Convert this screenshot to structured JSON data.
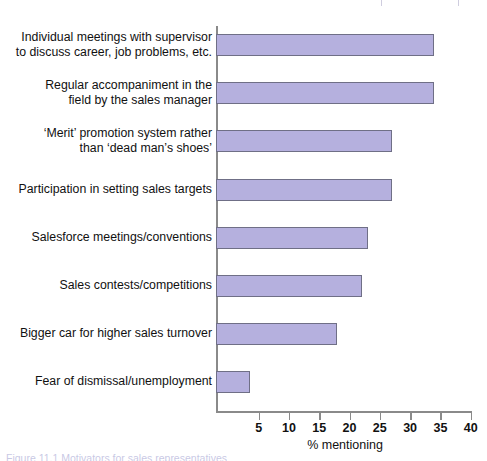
{
  "artifact": {
    "tab_name": "page-tab-fragment",
    "block_color": "#8e8bc4"
  },
  "colors": {
    "bar_fill": "#b5b0de",
    "bar_stroke": "#6f6f86",
    "axis": "#8a8a8a",
    "text": "#111111"
  },
  "caption": {
    "text": "Figure 11.1   Motivators for sales representatives"
  },
  "chart_data": {
    "type": "bar",
    "orientation": "horizontal",
    "title": "",
    "xlabel": "% mentioning",
    "ylabel": "",
    "xlim": [
      0,
      41
    ],
    "grid": false,
    "legend": false,
    "tick_values": [
      5,
      10,
      15,
      20,
      25,
      30,
      35,
      40
    ],
    "tick_labels": [
      "5",
      "10",
      "15",
      "20",
      "25",
      "30",
      "35",
      "40"
    ],
    "categories": [
      "Individual meetings with supervisor\nto discuss career, job problems, etc.",
      "Regular accompaniment in the\nfield by the sales manager",
      "‘Merit’ promotion system rather\nthan ‘dead man’s shoes’",
      "Participation in setting sales targets",
      "Salesforce meetings/conventions",
      "Sales contests/competitions",
      "Bigger car for higher sales turnover",
      "Fear of dismissal/unemployment"
    ],
    "values": [
      34,
      34,
      27,
      27,
      23,
      22,
      18,
      3.5
    ]
  }
}
